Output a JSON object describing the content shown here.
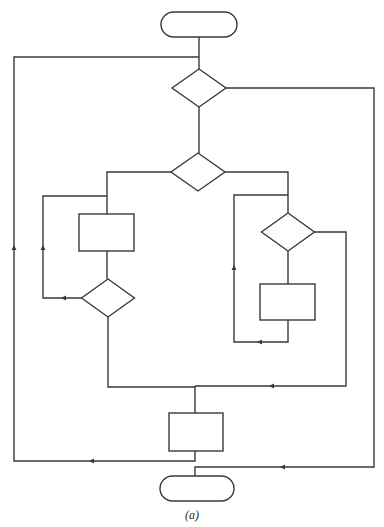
{
  "caption": "(a)",
  "colors": {
    "stroke": "#3a3a3a",
    "background": "#ffffff"
  },
  "nodes": [
    {
      "id": "start",
      "type": "terminator",
      "x": 161,
      "y": 12,
      "w": 76,
      "h": 25
    },
    {
      "id": "decision-1",
      "type": "decision",
      "cx": 199,
      "cy": 88,
      "w": 54,
      "h": 38
    },
    {
      "id": "decision-2",
      "type": "decision",
      "cx": 198,
      "cy": 172,
      "w": 54,
      "h": 38
    },
    {
      "id": "process-left",
      "type": "process",
      "x": 79,
      "y": 214,
      "w": 55,
      "h": 37
    },
    {
      "id": "decision-left",
      "type": "decision",
      "cx": 108,
      "cy": 298,
      "w": 53,
      "h": 38
    },
    {
      "id": "decision-right",
      "type": "decision",
      "cx": 288,
      "cy": 232,
      "w": 53,
      "h": 38
    },
    {
      "id": "process-right",
      "type": "process",
      "x": 260,
      "y": 284,
      "w": 55,
      "h": 36
    },
    {
      "id": "process-bottom",
      "type": "process",
      "x": 169,
      "y": 413,
      "w": 54,
      "h": 38
    },
    {
      "id": "end",
      "type": "terminator",
      "x": 160,
      "y": 476,
      "w": 74,
      "h": 25
    }
  ],
  "edges": [
    {
      "id": "start-to-d1",
      "points": [
        [
          199,
          37
        ],
        [
          199,
          69
        ]
      ]
    },
    {
      "id": "outer-left-loop",
      "points": [
        [
          195,
          451
        ],
        [
          195,
          461
        ],
        [
          14,
          461
        ],
        [
          14,
          57
        ],
        [
          199,
          57
        ]
      ],
      "arrows": [
        [
          92,
          461,
          "left"
        ],
        [
          14,
          248,
          "up"
        ]
      ]
    },
    {
      "id": "d1-right-exit",
      "points": [
        [
          226,
          88
        ],
        [
          374,
          88
        ],
        [
          374,
          467
        ],
        [
          195,
          467
        ],
        [
          195,
          476
        ]
      ],
      "arrows": [
        [
          283,
          467,
          "left"
        ]
      ]
    },
    {
      "id": "d1-to-d2",
      "points": [
        [
          199,
          107
        ],
        [
          199,
          153
        ]
      ]
    },
    {
      "id": "d2-left-branch",
      "points": [
        [
          171,
          172
        ],
        [
          107,
          172
        ],
        [
          107,
          214
        ]
      ]
    },
    {
      "id": "left-loop",
      "points": [
        [
          81,
          298
        ],
        [
          43,
          298
        ],
        [
          43,
          196
        ],
        [
          107,
          196
        ]
      ],
      "arrows": [
        [
          64,
          298,
          "left"
        ],
        [
          43,
          248,
          "up"
        ]
      ]
    },
    {
      "id": "proc-left-to-dleft",
      "points": [
        [
          107,
          251
        ],
        [
          107,
          279
        ]
      ]
    },
    {
      "id": "dleft-to-merge",
      "points": [
        [
          108,
          317
        ],
        [
          108,
          387
        ],
        [
          195,
          387
        ]
      ]
    },
    {
      "id": "d2-right-branch",
      "points": [
        [
          225,
          172
        ],
        [
          288,
          172
        ],
        [
          288,
          213
        ]
      ]
    },
    {
      "id": "right-loop",
      "points": [
        [
          288,
          320
        ],
        [
          288,
          342
        ],
        [
          234,
          342
        ],
        [
          234,
          195
        ],
        [
          288,
          195
        ]
      ],
      "arrows": [
        [
          260,
          342,
          "left"
        ],
        [
          234,
          268,
          "up"
        ]
      ]
    },
    {
      "id": "dright-to-proc",
      "points": [
        [
          288,
          251
        ],
        [
          288,
          284
        ]
      ]
    },
    {
      "id": "dright-exit",
      "points": [
        [
          314,
          232
        ],
        [
          346,
          232
        ],
        [
          346,
          386
        ],
        [
          195,
          386
        ]
      ],
      "arrows": [
        [
          272,
          386,
          "left"
        ]
      ]
    },
    {
      "id": "merge-to-bottom-proc",
      "points": [
        [
          195,
          386
        ],
        [
          195,
          413
        ]
      ]
    }
  ]
}
